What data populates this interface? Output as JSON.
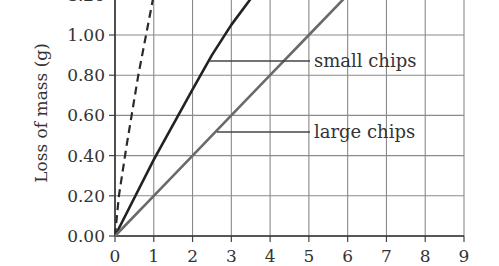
{
  "chart_data": {
    "type": "line",
    "title": "",
    "xlabel": "",
    "ylabel": "Loss of mass (g)",
    "xlim": [
      0,
      9
    ],
    "ylim": [
      0,
      1.2
    ],
    "x_ticks": [
      "0",
      "1",
      "2",
      "3",
      "4",
      "5",
      "6",
      "7",
      "8",
      "9"
    ],
    "y_ticks": [
      "0.00",
      "0.20",
      "0.40",
      "0.60",
      "0.80",
      "1.00",
      "1.20"
    ],
    "grid": true,
    "legend": "none (inline annotations)",
    "series": [
      {
        "name": "powder (dashed)",
        "style": "dashed",
        "color": "#2a2a2a",
        "x": [
          0,
          0.1,
          0.3,
          0.6,
          1.0
        ],
        "y": [
          0,
          0.2,
          0.45,
          0.8,
          1.2
        ]
      },
      {
        "name": "small chips",
        "style": "solid",
        "color": "#222222",
        "x": [
          0,
          1,
          2,
          2.5,
          3,
          3.5
        ],
        "y": [
          0,
          0.38,
          0.73,
          0.9,
          1.05,
          1.18
        ]
      },
      {
        "name": "large chips",
        "style": "solid",
        "color": "#6a6a6a",
        "x": [
          0,
          1,
          2,
          3,
          4,
          5,
          6
        ],
        "y": [
          0,
          0.2,
          0.4,
          0.6,
          0.8,
          1.0,
          1.2
        ]
      }
    ],
    "annotations": [
      {
        "text": "small chips",
        "points_to": "small chips"
      },
      {
        "text": "large chips",
        "points_to": "large chips"
      }
    ]
  }
}
